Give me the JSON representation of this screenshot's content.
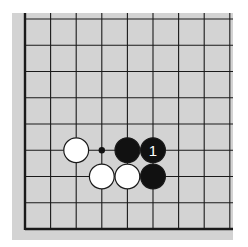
{
  "diagram": {
    "type": "go-board-fragment",
    "visible_columns": 9,
    "visible_rows": 9,
    "edges": {
      "left": true,
      "bottom": true,
      "top": false,
      "right": false
    },
    "colors": {
      "board": "#d3d3d3",
      "line": "#1a1a1a",
      "black_stone": "#111111",
      "white_stone": "#ffffff",
      "label_on_black": "#ffffff"
    },
    "stones": [
      {
        "color": "white",
        "col": 2,
        "row": 5,
        "label": ""
      },
      {
        "color": "black",
        "col": 4,
        "row": 5,
        "label": ""
      },
      {
        "color": "black",
        "col": 5,
        "row": 5,
        "label": "1"
      },
      {
        "color": "white",
        "col": 3,
        "row": 6,
        "label": ""
      },
      {
        "color": "white",
        "col": 4,
        "row": 6,
        "label": ""
      },
      {
        "color": "black",
        "col": 5,
        "row": 6,
        "label": ""
      }
    ],
    "markers": [
      {
        "type": "dot",
        "col": 3,
        "row": 5
      }
    ]
  }
}
